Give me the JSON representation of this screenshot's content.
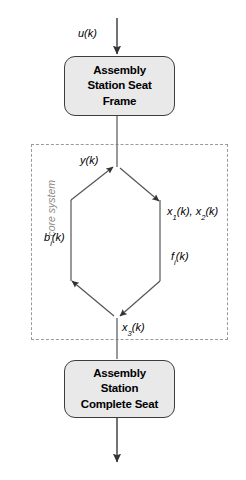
{
  "diagram": {
    "canvas": {
      "width": 246,
      "height": 480,
      "background": "#ffffff"
    },
    "colors": {
      "box_fill": "#e9e9e9",
      "box_stroke": "#3d3d3d",
      "arrow": "#444444",
      "dashed_border": "#9a9a9a",
      "caption_text": "#8a8a8a",
      "label_text": "#000000"
    },
    "blocks": [
      {
        "id": "seat-frame",
        "label": "Assembly\nStation Seat\nFrame",
        "shape": "rounded-rectangle",
        "fill": "#e9e9e9"
      },
      {
        "id": "complete-seat",
        "label": "Assembly\nStation\nComplete Seat",
        "shape": "rounded-rectangle",
        "fill": "#e9e9e9"
      }
    ],
    "region": {
      "id": "core-system",
      "caption": "core system",
      "style": "dashed",
      "orientation": "vertical-label-left"
    },
    "signals": {
      "input": {
        "base": "u",
        "sub": "",
        "arg": "(k)",
        "full": "u(k)"
      },
      "output_y": {
        "base": "y",
        "sub": "",
        "arg": "(k)",
        "full": "y(k)"
      },
      "states_x12": {
        "base": "x",
        "sub": "1",
        "arg": "(k), ",
        "base2": "x",
        "sub2": "2",
        "arg2": "(k)",
        "full": "x1(k), x2(k)"
      },
      "flow_f": {
        "base": "f",
        "sub": "i",
        "arg": "(k)",
        "full": "fi(k)"
      },
      "buffer_b": {
        "base": "b",
        "sub": "i",
        "arg": "(k)",
        "full": "bi(k)"
      },
      "state_x3": {
        "base": "x",
        "sub": "3",
        "arg": "(k)",
        "full": "x3(k)"
      }
    },
    "edges": [
      {
        "id": "input-to-seat-frame",
        "from": "external-input",
        "to": "seat-frame",
        "label": "u(k)",
        "direction": "down"
      },
      {
        "id": "seat-frame-to-cycle",
        "from": "seat-frame",
        "to": "cycle-top-vertex",
        "label": "",
        "direction": "down"
      },
      {
        "id": "cycle-top-to-right",
        "from": "cycle-top-vertex",
        "to": "cycle-right-vertex",
        "label": "x1(k), x2(k)",
        "direction": "down-right"
      },
      {
        "id": "cycle-right-to-bottom",
        "from": "cycle-right-vertex",
        "to": "cycle-bottom-vertex",
        "label": "fi(k)",
        "direction": "down-left"
      },
      {
        "id": "cycle-bottom-to-left",
        "from": "cycle-bottom-vertex",
        "to": "cycle-left-vertex",
        "label": "bi(k)",
        "direction": "up-left"
      },
      {
        "id": "cycle-left-to-top",
        "from": "cycle-left-vertex",
        "to": "cycle-top-vertex",
        "label": "y(k)",
        "direction": "up-right"
      },
      {
        "id": "cycle-to-complete-seat",
        "from": "cycle-bottom-vertex",
        "to": "complete-seat",
        "label": "x3(k)",
        "direction": "down"
      },
      {
        "id": "complete-seat-to-output",
        "from": "complete-seat",
        "to": "external-output",
        "label": "",
        "direction": "down"
      }
    ]
  }
}
